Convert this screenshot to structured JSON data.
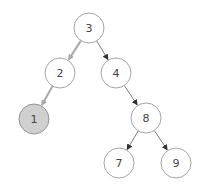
{
  "diagram": {
    "type": "binary-tree",
    "colors": {
      "node_fill": "#ffffff",
      "node_stroke": "#9a9a9a",
      "highlight_fill": "#d0d0d0",
      "highlight_stroke": "#8a8a8a",
      "edge": "#6a6a6a",
      "highlight_edge": "#a8a8a8",
      "text": "#444444"
    },
    "nodes": [
      {
        "id": "n3",
        "label": "3",
        "x": 89,
        "y": 28,
        "highlighted": false
      },
      {
        "id": "n2",
        "label": "2",
        "x": 60,
        "y": 73,
        "highlighted": false
      },
      {
        "id": "n4",
        "label": "4",
        "x": 116,
        "y": 73,
        "highlighted": false
      },
      {
        "id": "n1",
        "label": "1",
        "x": 34,
        "y": 119,
        "highlighted": true
      },
      {
        "id": "n8",
        "label": "8",
        "x": 146,
        "y": 118,
        "highlighted": false
      },
      {
        "id": "n7",
        "label": "7",
        "x": 119,
        "y": 163,
        "highlighted": false
      },
      {
        "id": "n9",
        "label": "9",
        "x": 176,
        "y": 163,
        "highlighted": false
      }
    ],
    "edges": [
      {
        "from": "n3",
        "to": "n2",
        "highlighted": true
      },
      {
        "from": "n2",
        "to": "n1",
        "highlighted": true
      },
      {
        "from": "n3",
        "to": "n4",
        "highlighted": false
      },
      {
        "from": "n4",
        "to": "n8",
        "highlighted": false
      },
      {
        "from": "n8",
        "to": "n7",
        "highlighted": false
      },
      {
        "from": "n8",
        "to": "n9",
        "highlighted": false
      }
    ],
    "radius": 15
  }
}
